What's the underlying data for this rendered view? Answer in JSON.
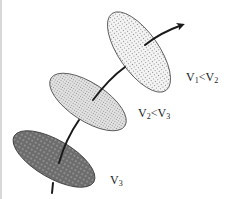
{
  "diagram": {
    "type": "trajectory through three tilted elliptical cross-sections",
    "ellipses": [
      {
        "id": "top",
        "fill": "light-dotted",
        "base_color": "#f4f4f4",
        "dot_color": "#8a8a8a"
      },
      {
        "id": "middle",
        "fill": "medium-dotted",
        "base_color": "#e6e6e6",
        "dot_color": "#7a7a7a"
      },
      {
        "id": "bottom",
        "fill": "dark-dotted",
        "base_color": "#6e6e6e",
        "dot_color": "#e8e8e8"
      }
    ],
    "arrow": {
      "direction": "upper-right",
      "color": "#1a1a1a"
    },
    "labels": {
      "top": {
        "v1": "V",
        "s1": "1",
        "op": "<",
        "v2": "V",
        "s2": "2"
      },
      "middle": {
        "v1": "V",
        "s1": "2",
        "op": "<",
        "v2": "V",
        "s2": "3"
      },
      "bottom": {
        "v1": "V",
        "s1": "3"
      }
    }
  }
}
